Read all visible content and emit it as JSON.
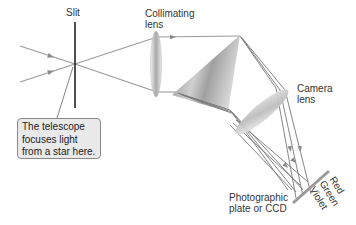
{
  "diagram": {
    "labels": {
      "slit": "Slit",
      "collimating_lens": "Collimating\nlens",
      "camera_lens": "Camera\nlens",
      "plate": "Photographic\nplate or CCD",
      "callout": "The telescope\nfocuses light\nfrom a star here."
    },
    "spectrum_labels": [
      "Red",
      "Green",
      "Violet"
    ],
    "components": [
      "incoming-light-rays",
      "slit",
      "collimating-lens",
      "prism",
      "camera-lens",
      "photographic-plate"
    ],
    "colors": {
      "ray": "#8a8a8a",
      "slit": "#222222",
      "callout_bg": "#e9e9e9",
      "plate": "#9a9a9a"
    }
  }
}
